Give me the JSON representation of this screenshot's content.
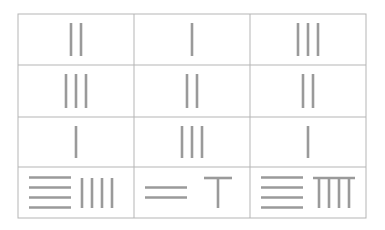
{
  "colors": {
    "rod": "#9a9a9a",
    "border": "#b5b5b5",
    "background": "#ffffff"
  },
  "grid": {
    "rows": 4,
    "cols": 3,
    "cells": [
      [
        {
          "value": 2,
          "tens_h": 0,
          "units": 2
        },
        {
          "value": 1,
          "tens_h": 0,
          "units": 1
        },
        {
          "value": 3,
          "tens_h": 0,
          "units": 3
        }
      ],
      [
        {
          "value": 3,
          "tens_h": 0,
          "units": 3
        },
        {
          "value": 2,
          "tens_h": 0,
          "units": 2
        },
        {
          "value": 2,
          "tens_h": 0,
          "units": 2
        }
      ],
      [
        {
          "value": 1,
          "tens_h": 0,
          "units": 1
        },
        {
          "value": 3,
          "tens_h": 0,
          "units": 3
        },
        {
          "value": 1,
          "tens_h": 0,
          "units": 1
        }
      ],
      [
        {
          "value": 44,
          "tens_h": 4,
          "units": 4
        },
        {
          "value": 26,
          "tens_h": 2,
          "units": 6
        },
        {
          "value": 49,
          "tens_h": 4,
          "units": 9
        }
      ]
    ]
  }
}
